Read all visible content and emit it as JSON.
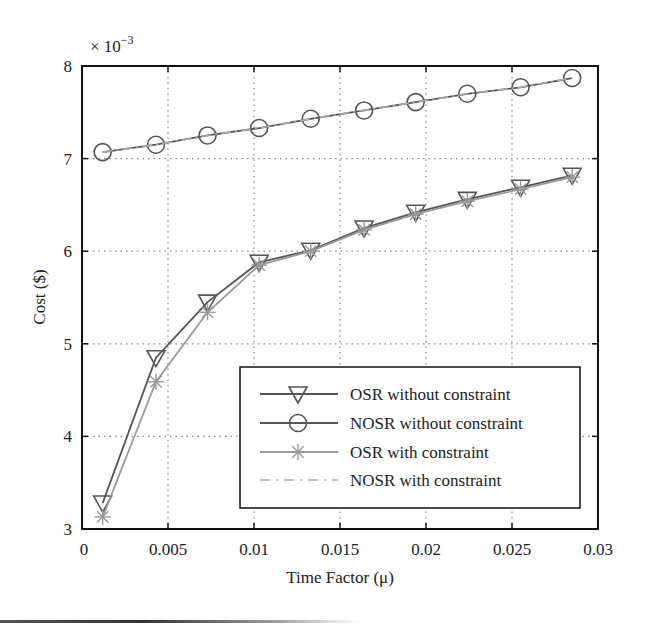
{
  "chart_data": {
    "type": "line",
    "title": "",
    "xlabel": "Time Factor (μ)",
    "ylabel": "Cost ($)",
    "y_multiplier": "× 10",
    "y_multiplier_exp": "−3",
    "xlim": [
      0,
      0.03
    ],
    "ylim": [
      3,
      8
    ],
    "xticks": [
      0,
      0.005,
      0.01,
      0.015,
      0.02,
      0.025,
      0.03
    ],
    "xtick_labels": [
      "0",
      "0.005",
      "0.01",
      "0.015",
      "0.02",
      "0.025",
      "0.03"
    ],
    "yticks": [
      3,
      4,
      5,
      6,
      7,
      8
    ],
    "ytick_labels": [
      "3",
      "4",
      "5",
      "6",
      "7",
      "8"
    ],
    "grid": true,
    "legend_position": "lower right",
    "x": [
      0.0012,
      0.0043,
      0.0073,
      0.0103,
      0.0133,
      0.0164,
      0.0194,
      0.0224,
      0.0255,
      0.0285
    ],
    "series": [
      {
        "name": "OSR without constraint",
        "marker": "triangle-down",
        "line": "solid",
        "color": "#555555",
        "values": [
          3.28,
          4.85,
          5.45,
          5.88,
          6.01,
          6.25,
          6.42,
          6.56,
          6.69,
          6.82
        ]
      },
      {
        "name": "NOSR without constraint",
        "marker": "circle",
        "line": "solid",
        "color": "#555555",
        "values": [
          7.07,
          7.15,
          7.25,
          7.33,
          7.43,
          7.52,
          7.61,
          7.7,
          7.77,
          7.87
        ]
      },
      {
        "name": "OSR with constraint",
        "marker": "star",
        "line": "solid",
        "color": "#999999",
        "values": [
          3.13,
          4.59,
          5.34,
          5.85,
          6.0,
          6.23,
          6.4,
          6.54,
          6.67,
          6.8
        ]
      },
      {
        "name": "NOSR with constraint",
        "marker": "none",
        "line": "dashdot",
        "color": "#aaaaaa",
        "values": [
          7.07,
          7.15,
          7.25,
          7.33,
          7.43,
          7.52,
          7.61,
          7.7,
          7.77,
          7.87
        ]
      }
    ]
  }
}
